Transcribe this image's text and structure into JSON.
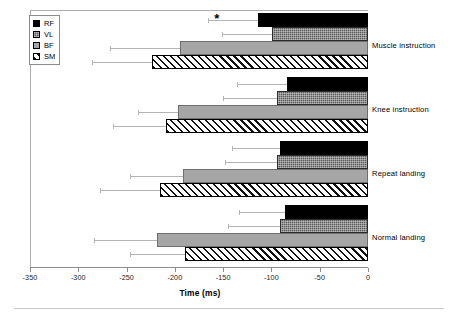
{
  "chart_data": {
    "type": "bar",
    "orientation": "horizontal",
    "title": "",
    "xlabel": "Time (ms)",
    "ylabel": "",
    "xlim": [
      -350,
      0
    ],
    "xticks": [
      -350,
      -300,
      -250,
      -200,
      -150,
      -100,
      -50,
      0
    ],
    "xticklabels": [
      "-350",
      "-300",
      "-250",
      "-200",
      "-150",
      "-100",
      "-50",
      "0"
    ],
    "grid": false,
    "legend_position": "upper-left",
    "categories": [
      "Normal landing",
      "Repeat landing",
      "Knee instruction",
      "Muscle instruction"
    ],
    "series": [
      {
        "name": "RF",
        "fill": "solid-black",
        "color": "#000000",
        "values": [
          -86,
          -91,
          -84,
          -114
        ],
        "errors": [
          -134,
          -141,
          -136,
          -166
        ]
      },
      {
        "name": "VL",
        "fill": "dark-gray-dotted",
        "color": "#595959",
        "values": [
          -91,
          -94,
          -94,
          -99
        ],
        "errors": [
          -145,
          -148,
          -150,
          -151
        ]
      },
      {
        "name": "BF",
        "fill": "light-gray",
        "color": "#a6a6a6",
        "values": [
          -219,
          -192,
          -197,
          -195
        ],
        "errors": [
          -284,
          -246,
          -238,
          -267
        ]
      },
      {
        "name": "SM",
        "fill": "diagonal-hatch",
        "color": "#ffffff",
        "values": [
          -190,
          -215,
          -209,
          -224
        ],
        "errors": [
          -246,
          -277,
          -264,
          -286
        ]
      }
    ],
    "annotations": [
      {
        "text": "*",
        "name": "significance-marker",
        "series": "RF",
        "category": "Muscle instruction",
        "x": -155,
        "note": "significance marker above RF bar of Muscle instruction"
      }
    ]
  },
  "legend": {
    "entries": [
      {
        "label": "RF",
        "swatch": "solid-black"
      },
      {
        "label": "VL",
        "swatch": "dark-gray-dotted"
      },
      {
        "label": "BF",
        "swatch": "light-gray"
      },
      {
        "label": "SM",
        "swatch": "diagonal-hatch"
      }
    ]
  },
  "axis": {
    "x_title": "Time (ms)",
    "tick_labels": [
      "-350",
      "-300",
      "-250",
      "-200",
      "-150",
      "-100",
      "-50",
      "0"
    ]
  },
  "group_labels": [
    "Muscle instruction",
    "Knee instruction",
    "Repeat landing",
    "Normal landing"
  ],
  "annotation_star": "*"
}
